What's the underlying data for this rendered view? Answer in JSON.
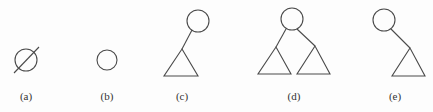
{
  "diagram": {
    "stroke_color": "#4a4a4a",
    "background": "#fdfdfd",
    "panels": [
      {
        "id": "a",
        "label": "(a)",
        "label_pos": [
          26,
          90
        ],
        "description": "empty tree (null symbol: circle with slash)",
        "nodes": [
          {
            "type": "circle",
            "cx": 26,
            "cy": 60,
            "r": 11
          }
        ],
        "edges": [
          {
            "x1": 14,
            "y1": 73,
            "x2": 39,
            "y2": 47
          }
        ],
        "subtrees": []
      },
      {
        "id": "b",
        "label": "(b)",
        "label_pos": [
          107,
          90
        ],
        "description": "single node",
        "nodes": [
          {
            "type": "circle",
            "cx": 107,
            "cy": 60,
            "r": 10
          }
        ],
        "edges": [],
        "subtrees": []
      },
      {
        "id": "c",
        "label": "(c)",
        "label_pos": [
          182,
          90
        ],
        "description": "root with left subtree only",
        "nodes": [
          {
            "type": "circle",
            "cx": 198,
            "cy": 21,
            "r": 11
          }
        ],
        "edges": [
          {
            "x1": 192,
            "y1": 30,
            "x2": 182,
            "y2": 49
          }
        ],
        "subtrees": [
          {
            "apex": [
              182,
              49
            ],
            "left": [
              164,
              76
            ],
            "right": [
              198,
              76
            ]
          }
        ]
      },
      {
        "id": "d",
        "label": "(d)",
        "label_pos": [
          294,
          90
        ],
        "description": "root with left and right subtrees",
        "nodes": [
          {
            "type": "circle",
            "cx": 292,
            "cy": 19,
            "r": 11
          }
        ],
        "edges": [
          {
            "x1": 286,
            "y1": 29,
            "x2": 276,
            "y2": 47
          },
          {
            "x1": 297,
            "y1": 29,
            "x2": 315,
            "y2": 46
          }
        ],
        "subtrees": [
          {
            "apex": [
              276,
              47
            ],
            "left": [
              258,
              74
            ],
            "right": [
              291,
              74
            ]
          },
          {
            "apex": [
              315,
              46
            ],
            "left": [
              297,
              74
            ],
            "right": [
              330,
              74
            ]
          }
        ]
      },
      {
        "id": "e",
        "label": "(e)",
        "label_pos": [
          395,
          90
        ],
        "description": "root with right subtree only",
        "nodes": [
          {
            "type": "circle",
            "cx": 384,
            "cy": 20,
            "r": 11
          }
        ],
        "edges": [
          {
            "x1": 391,
            "y1": 29,
            "x2": 410,
            "y2": 48
          }
        ],
        "subtrees": [
          {
            "apex": [
              410,
              48
            ],
            "left": [
              392,
              76
            ],
            "right": [
              425,
              76
            ]
          }
        ]
      }
    ]
  }
}
